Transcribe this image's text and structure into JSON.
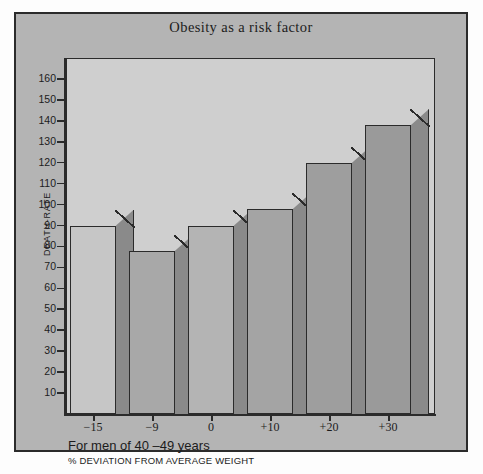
{
  "chart_data": {
    "type": "bar",
    "title": "Obesity as a risk factor",
    "xlabel": "% DEVIATION FROM AVERAGE WEIGHT",
    "ylabel": "DEATH-RATE",
    "subtitle": "For men of 40 –49 years",
    "categories": [
      "−15",
      "−9",
      "0",
      "+10",
      "+20",
      "+30"
    ],
    "values": [
      90,
      78,
      90,
      98,
      120,
      138
    ],
    "ylim": [
      0,
      170
    ],
    "yticks": [
      10,
      20,
      30,
      40,
      50,
      60,
      70,
      80,
      90,
      100,
      110,
      120,
      130,
      140,
      150,
      160
    ],
    "grid": false,
    "legend": "none",
    "style": "3d-bars",
    "colors": {
      "card": "#b4b4b4",
      "panel": "#cfcfcf",
      "axis": "#2b2b2b",
      "bar_front_light": "#c6c6c6",
      "bar_front_dark": "#a0a0a0",
      "bar_side": "#8a8a8a"
    }
  }
}
